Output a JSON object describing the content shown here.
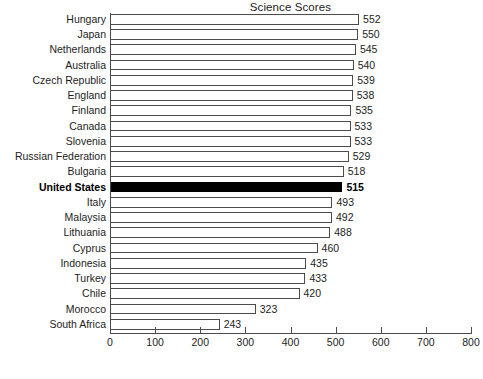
{
  "chart_data": {
    "type": "bar",
    "orientation": "horizontal",
    "title": "Science Scores",
    "xlabel": "",
    "ylabel": "",
    "xlim": [
      0,
      800
    ],
    "xticks": [
      0,
      100,
      200,
      300,
      400,
      500,
      600,
      700,
      800
    ],
    "grid": false,
    "legend": null,
    "highlight_category": "United States",
    "highlight_color": "#000000",
    "bar_fill_color": "#ffffff",
    "bar_border_color": "#4b4b4b",
    "categories": [
      "Hungary",
      "Japan",
      "Netherlands",
      "Australia",
      "Czech Republic",
      "England",
      "Finland",
      "Canada",
      "Slovenia",
      "Russian Federation",
      "Bulgaria",
      "United States",
      "Italy",
      "Malaysia",
      "Lithuania",
      "Cyprus",
      "Indonesia",
      "Turkey",
      "Chile",
      "Morocco",
      "South Africa"
    ],
    "values": [
      552,
      550,
      545,
      540,
      539,
      538,
      535,
      533,
      533,
      529,
      518,
      515,
      493,
      492,
      488,
      460,
      435,
      433,
      420,
      323,
      243
    ],
    "value_labels": [
      "552",
      "550",
      "545",
      "540",
      "539",
      "538",
      "535",
      "533",
      "533",
      "529",
      "518",
      "515",
      "493",
      "492",
      "488",
      "460",
      "435",
      "433",
      "420",
      "323",
      "243"
    ],
    "xtick_labels": [
      "0",
      "100",
      "200",
      "300",
      "400",
      "500",
      "600",
      "700",
      "800"
    ]
  }
}
